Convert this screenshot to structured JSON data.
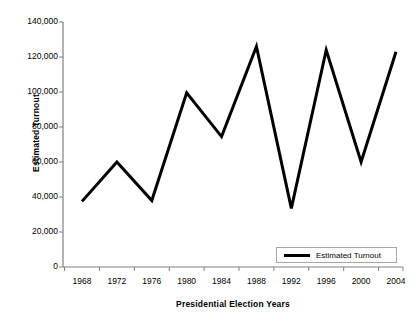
{
  "chart_data": {
    "type": "line",
    "title": "",
    "xlabel": "Presidential Election Years",
    "ylabel": "Estimated Turnout",
    "categories": [
      "1968",
      "1972",
      "1976",
      "1980",
      "1984",
      "1988",
      "1992",
      "1996",
      "2000",
      "2004"
    ],
    "series": [
      {
        "name": "Estimated Turnout",
        "values": [
          37500,
          60000,
          38000,
          99500,
          74500,
          126000,
          33500,
          124000,
          60000,
          123000
        ]
      }
    ],
    "ylim": [
      0,
      140000
    ],
    "yticks": [
      0,
      20000,
      40000,
      60000,
      80000,
      100000,
      120000,
      140000
    ],
    "ytick_labels": [
      "0",
      "20,000",
      "40,000",
      "60,000",
      "80,000",
      "100,000",
      "120,000",
      "140,000"
    ],
    "grid": false,
    "legend": {
      "position": "bottom-right",
      "entries": [
        "Estimated Turnout"
      ]
    },
    "line_color": "#000000",
    "axis_color": "#808080"
  }
}
